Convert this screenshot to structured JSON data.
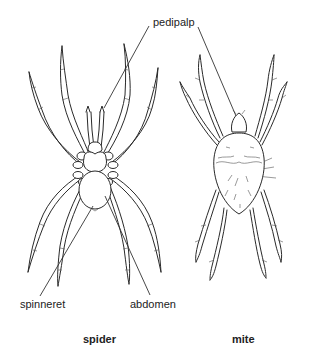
{
  "figure": {
    "labels": {
      "pedipalp": "pedipalp",
      "spinneret": "spinneret",
      "abdomen": "abdomen"
    },
    "captions": {
      "spider": "spider",
      "mite": "mite"
    },
    "colors": {
      "line": "#2a2a2a",
      "background": "#ffffff",
      "text": "#222222"
    }
  }
}
